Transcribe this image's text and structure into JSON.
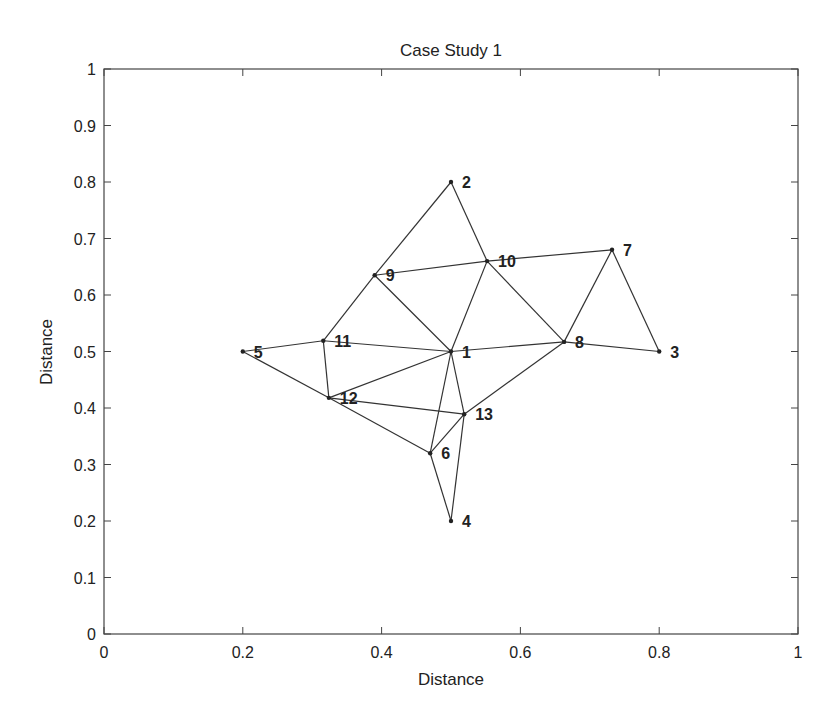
{
  "chart_data": {
    "type": "scatter",
    "subtype": "network-graph",
    "title": "Case Study 1",
    "xlabel": "Distance",
    "ylabel": "Distance",
    "xlim": [
      0,
      1
    ],
    "ylim": [
      0,
      1
    ],
    "grid": false,
    "x_ticks": [
      "0",
      "0.2",
      "0.4",
      "0.6",
      "0.8",
      "1"
    ],
    "x_tick_values": [
      0,
      0.2,
      0.4,
      0.6,
      0.8,
      1
    ],
    "y_ticks": [
      "0",
      "0.1",
      "0.2",
      "0.3",
      "0.4",
      "0.5",
      "0.6",
      "0.7",
      "0.8",
      "0.9",
      "1"
    ],
    "y_tick_values": [
      0,
      0.1,
      0.2,
      0.3,
      0.4,
      0.5,
      0.6,
      0.7,
      0.8,
      0.9,
      1
    ],
    "nodes": [
      {
        "id": "1",
        "x": 0.5,
        "y": 0.5
      },
      {
        "id": "2",
        "x": 0.5,
        "y": 0.8
      },
      {
        "id": "3",
        "x": 0.8,
        "y": 0.5
      },
      {
        "id": "4",
        "x": 0.5,
        "y": 0.2
      },
      {
        "id": "5",
        "x": 0.2,
        "y": 0.5
      },
      {
        "id": "6",
        "x": 0.47,
        "y": 0.32
      },
      {
        "id": "7",
        "x": 0.732,
        "y": 0.68
      },
      {
        "id": "8",
        "x": 0.663,
        "y": 0.517
      },
      {
        "id": "9",
        "x": 0.39,
        "y": 0.635
      },
      {
        "id": "10",
        "x": 0.552,
        "y": 0.66
      },
      {
        "id": "11",
        "x": 0.316,
        "y": 0.519
      },
      {
        "id": "12",
        "x": 0.324,
        "y": 0.418
      },
      {
        "id": "13",
        "x": 0.519,
        "y": 0.389
      }
    ],
    "edges": [
      [
        "2",
        "9"
      ],
      [
        "2",
        "10"
      ],
      [
        "9",
        "10"
      ],
      [
        "9",
        "11"
      ],
      [
        "9",
        "1"
      ],
      [
        "10",
        "1"
      ],
      [
        "10",
        "7"
      ],
      [
        "10",
        "8"
      ],
      [
        "7",
        "8"
      ],
      [
        "7",
        "3"
      ],
      [
        "8",
        "3"
      ],
      [
        "1",
        "8"
      ],
      [
        "1",
        "11"
      ],
      [
        "11",
        "5"
      ],
      [
        "5",
        "12"
      ],
      [
        "11",
        "12"
      ],
      [
        "12",
        "1"
      ],
      [
        "12",
        "13"
      ],
      [
        "12",
        "6"
      ],
      [
        "1",
        "6"
      ],
      [
        "1",
        "13"
      ],
      [
        "13",
        "8"
      ],
      [
        "13",
        "6"
      ],
      [
        "13",
        "4"
      ],
      [
        "6",
        "4"
      ]
    ]
  }
}
